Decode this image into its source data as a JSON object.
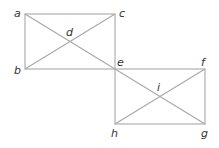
{
  "diagram": {
    "line_color": "#a8a8a8",
    "label_color": "#333333",
    "points": {
      "a": "a",
      "b": "b",
      "c": "c",
      "d": "d",
      "e": "e",
      "f": "f",
      "g": "g",
      "h": "h",
      "i": "i"
    },
    "rectangles": [
      {
        "name": "abec",
        "corners": [
          "a",
          "c",
          "e",
          "b"
        ],
        "diagonals": [
          "a-e",
          "b-c"
        ],
        "center": "d"
      },
      {
        "name": "efgh",
        "corners": [
          "e",
          "f",
          "g",
          "h"
        ],
        "diagonals": [
          "e-g",
          "h-f"
        ],
        "center": "i"
      }
    ]
  }
}
